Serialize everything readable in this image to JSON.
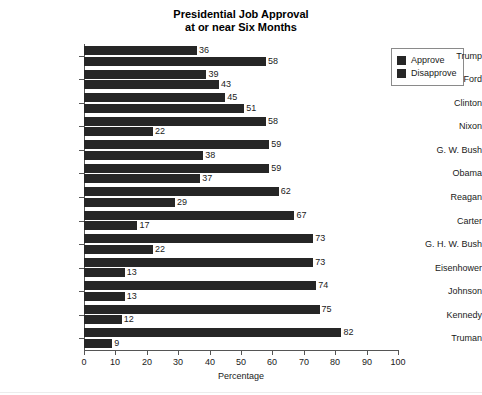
{
  "chart_data": {
    "type": "bar",
    "orientation": "horizontal",
    "grouped": true,
    "title": "Presidential Job Approval at or near Six Months",
    "title_lines": [
      "Presidential Job Approval",
      "at or near Six Months"
    ],
    "xlabel": "Percentage",
    "ylabel": "",
    "xlim": [
      0,
      100
    ],
    "xticks": [
      0,
      10,
      20,
      30,
      40,
      50,
      60,
      70,
      80,
      90,
      100
    ],
    "grid": false,
    "legend_position": "top-right",
    "categories": [
      "Trump",
      "Ford",
      "Clinton",
      "Nixon",
      "G. W. Bush",
      "Obama",
      "Reagan",
      "Carter",
      "G. H. W. Bush",
      "Eisenhower",
      "Johnson",
      "Kennedy",
      "Truman"
    ],
    "series": [
      {
        "name": "Approve",
        "color": "#262626",
        "values": [
          36,
          39,
          45,
          58,
          59,
          59,
          62,
          67,
          73,
          73,
          74,
          75,
          82
        ]
      },
      {
        "name": "Disapprove",
        "color": "#262626",
        "values": [
          58,
          43,
          51,
          22,
          38,
          37,
          29,
          17,
          22,
          13,
          13,
          12,
          9
        ]
      }
    ]
  },
  "legend": {
    "items": [
      {
        "label": "Approve",
        "color": "#262626"
      },
      {
        "label": "Disapprove",
        "color": "#262626"
      }
    ]
  },
  "colors": {
    "bar": "#262626",
    "axis": "#555555",
    "text": "#1a1a1a",
    "background": "#ffffff"
  }
}
